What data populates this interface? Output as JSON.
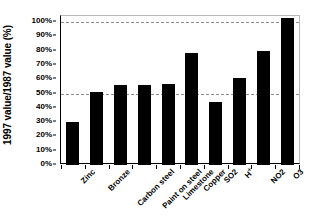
{
  "chart_data": {
    "type": "bar",
    "title": "",
    "subtitle": "",
    "xlabel": "",
    "ylabel": "1997 value/1987 value (%)",
    "categories": [
      "Zinc",
      "Bronze",
      "Carbon steel",
      "Paint on steel",
      "Limestone",
      "Copper",
      "SO2",
      "H+",
      "NO2",
      "O3"
    ],
    "values": [
      30,
      51,
      56,
      56,
      57,
      78,
      44,
      61,
      80,
      103
    ],
    "value_labels": [
      "30%",
      "51%",
      "56%",
      "56%",
      "57%",
      "78%",
      "44%",
      "61%",
      "80%",
      "103%"
    ],
    "series": [
      {
        "name": "1997 value/1987 value",
        "values": [
          30,
          51,
          56,
          56,
          57,
          78,
          44,
          61,
          80,
          103
        ]
      }
    ],
    "ylim": [
      0,
      107
    ],
    "ytick_values": [
      0,
      10,
      20,
      30,
      40,
      50,
      60,
      70,
      80,
      90,
      100
    ],
    "ytick_labels": [
      "0%",
      "10%",
      "20%",
      "30%",
      "40%",
      "50%",
      "60%",
      "70%",
      "80%",
      "90%",
      "100%"
    ],
    "gridlines": {
      "enabled": true,
      "orientation": "horizontal",
      "style": "dashed",
      "color": "#8f8f8f",
      "values": [
        50,
        100
      ]
    },
    "legend": {
      "visible": false,
      "position": "none",
      "entries": []
    },
    "bar_color": "#000000",
    "axis_color": "#000000",
    "frame_color": "#b9b9b9",
    "background_color": "#ffffff"
  }
}
